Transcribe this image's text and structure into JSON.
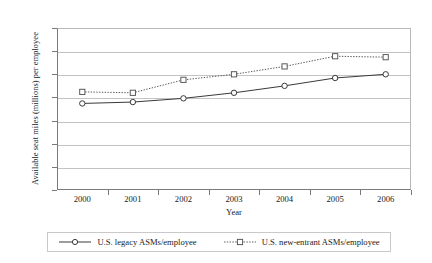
{
  "chart_data": {
    "type": "line",
    "title": "",
    "xlabel": "Year",
    "ylabel": "Available seat miles (millions) per employee",
    "categories": [
      "2000",
      "2001",
      "2002",
      "2003",
      "2004",
      "2005",
      "2006"
    ],
    "x": [
      2000,
      2001,
      2002,
      2003,
      2004,
      2005,
      2006
    ],
    "xlim": [
      1999.5,
      2006.5
    ],
    "ylim": [
      0,
      3.5
    ],
    "yticks": [
      "0",
      "0.5",
      "1",
      "1.5",
      "2",
      "2.5",
      "3",
      "3.5"
    ],
    "ytick_values": [
      0,
      0.5,
      1,
      1.5,
      2,
      2.5,
      3,
      3.5
    ],
    "grid": "horizontal",
    "legend_position": "bottom",
    "series": [
      {
        "name": "U.S. legacy ASMs/employee",
        "values": [
          1.87,
          1.9,
          1.98,
          2.1,
          2.25,
          2.42,
          2.5
        ],
        "line_style": "solid",
        "marker": "circle",
        "color": "#3a3a3a"
      },
      {
        "name": "U.S. new-entrant ASMs/employee",
        "values": [
          2.12,
          2.1,
          2.38,
          2.5,
          2.67,
          2.89,
          2.87
        ],
        "line_style": "dotted",
        "marker": "square",
        "color": "#5a5a5a"
      }
    ]
  }
}
